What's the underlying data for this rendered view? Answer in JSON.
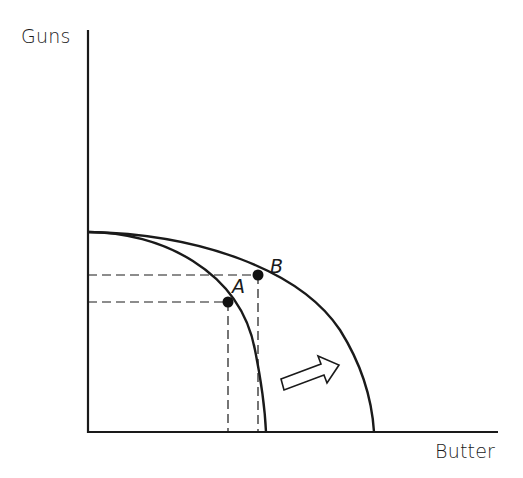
{
  "diagram": {
    "type": "production-possibilities-frontier",
    "y_axis_label": "Guns",
    "x_axis_label": "Butter",
    "points": [
      {
        "label": "A",
        "curve": "inner"
      },
      {
        "label": "B",
        "curve": "outer"
      }
    ],
    "curves": [
      "inner frontier",
      "outer frontier"
    ],
    "arrow": "outward shift",
    "colors": {
      "line": "#1a1a1a",
      "background": "#ffffff"
    }
  }
}
